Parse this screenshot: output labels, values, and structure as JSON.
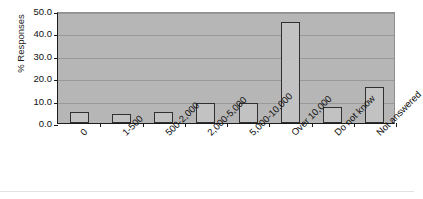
{
  "chart_data": {
    "type": "bar",
    "title": "",
    "xlabel": "",
    "ylabel": "% Responses",
    "ylim": [
      0,
      50
    ],
    "ytick_labels": [
      "50.0",
      "40.0",
      "30.0",
      "20.0",
      "10.0",
      "0.0"
    ],
    "yticks": [
      50,
      40,
      30,
      20,
      10,
      0
    ],
    "grid": true,
    "legend": "none",
    "categories": [
      "0",
      "1-500",
      "500-2,000",
      "2,000-5,000",
      "5,000-10,000",
      "Over 10,000",
      "Do not know",
      "Not answered"
    ],
    "values": [
      5,
      4,
      5,
      9,
      9,
      45,
      7,
      16
    ],
    "series": [
      {
        "name": "% Responses",
        "values": [
          5,
          4,
          5,
          9,
          9,
          45,
          7,
          16
        ]
      }
    ]
  },
  "style": {
    "plot_background": "#b6b6b6",
    "bar_fill": "#c2c2c2",
    "bar_edge": "#303030",
    "gridline_color": "#999999",
    "axis_color": "#1c1c1c",
    "text_color": "#101010",
    "figure_background": "#ffffff"
  }
}
